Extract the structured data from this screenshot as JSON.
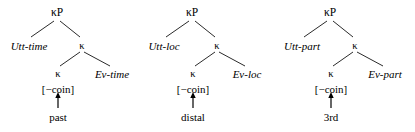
{
  "figure": {
    "line_color": "#2b2b2b",
    "text_color": "#000000",
    "background": "#ffffff",
    "kappa_symbol": "κ",
    "feature_label": "[−coin]",
    "arrow_glyph": "↑"
  },
  "trees": [
    {
      "id": "tree-time",
      "root": "κP",
      "specifier": "Utt-time",
      "mid_head": "κ",
      "low_head": "κ",
      "complement": "Ev-time",
      "feature": "[−coin]",
      "lexical_item": "past"
    },
    {
      "id": "tree-loc",
      "root": "κP",
      "specifier": "Utt-loc",
      "mid_head": "κ",
      "low_head": "κ",
      "complement": "Ev-loc",
      "feature": "[−coin]",
      "lexical_item": "distal"
    },
    {
      "id": "tree-part",
      "root": "κP",
      "specifier": "Utt-part",
      "mid_head": "κ",
      "low_head": "κ",
      "complement": "Ev-part",
      "feature": "[−coin]",
      "lexical_item": "3rd"
    }
  ]
}
